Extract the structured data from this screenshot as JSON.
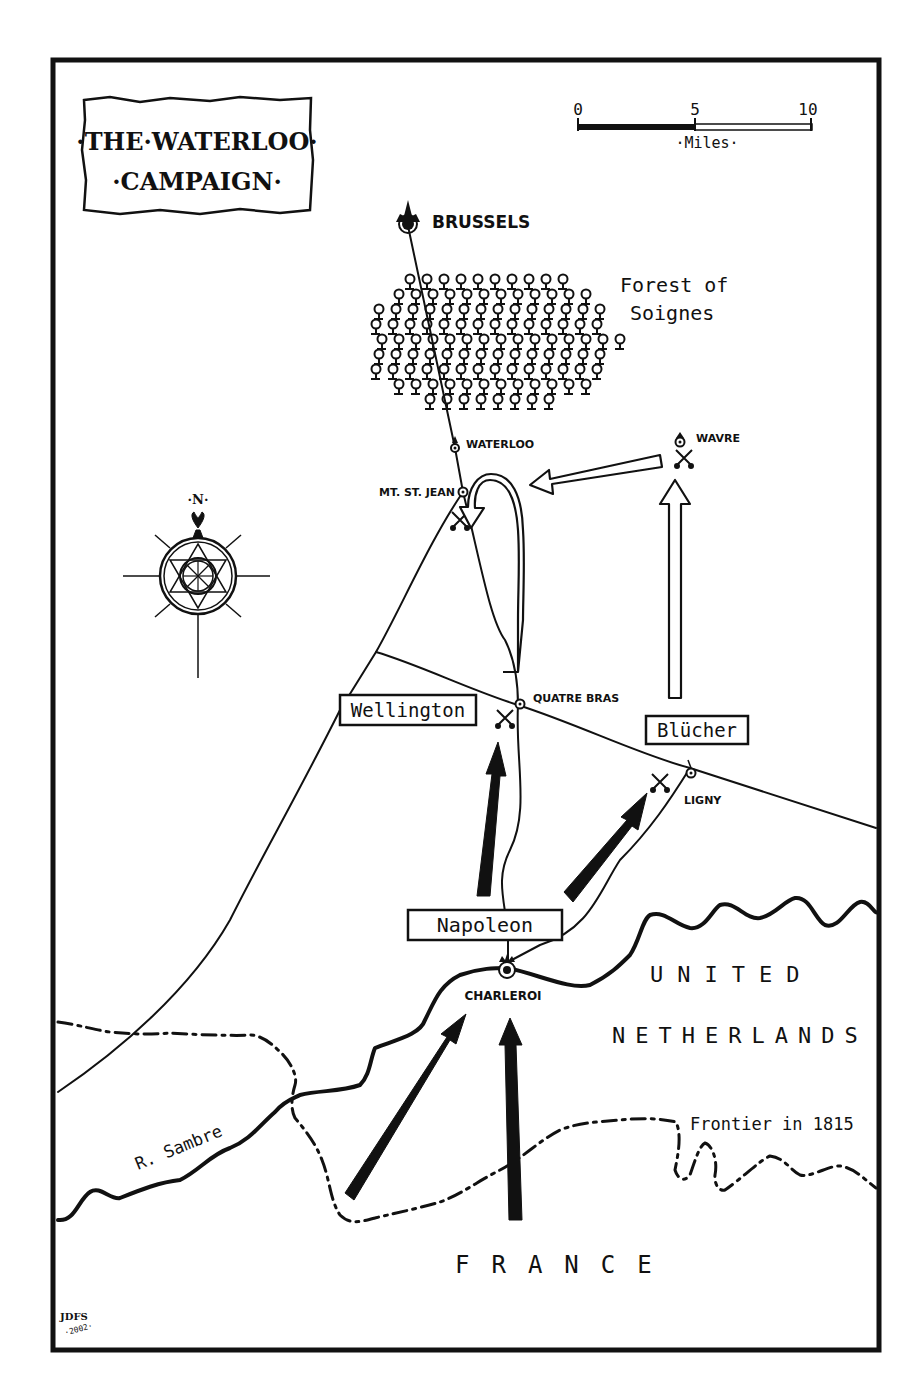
{
  "title": {
    "line1": "·THE·WATERLOO·",
    "line2": "·CAMPAIGN·"
  },
  "scale_bar": {
    "ticks": [
      "0",
      "5",
      "10"
    ],
    "unit_label": "·Miles·"
  },
  "compass": {
    "north_label": "·N·"
  },
  "places": {
    "brussels": "BRUSSELS",
    "waterloo": "WATERLOO",
    "mt_st_jean": "MT. ST. JEAN",
    "wavre": "WAVRE",
    "quatre_bras": "QUATRE BRAS",
    "ligny": "LIGNY",
    "charleroi": "CHARLEROI"
  },
  "features": {
    "forest_line1": "Forest of",
    "forest_line2": "Soignes",
    "river": "R. Sambre",
    "frontier": "Frontier in 1815"
  },
  "regions": {
    "united": "UNITED",
    "netherlands": "NETHERLANDS",
    "france": "FRANCE"
  },
  "armies": {
    "wellington": "Wellington",
    "blucher": "Blücher",
    "napoleon": "Napoleon"
  },
  "signature": {
    "initials": "JDFS",
    "year": "·2002·"
  },
  "battles": [
    {
      "name": "Waterloo (Mt. St. Jean)",
      "x": 460,
      "y": 520
    },
    {
      "name": "Wavre",
      "x": 684,
      "y": 458
    },
    {
      "name": "Quatre Bras",
      "x": 505,
      "y": 718
    },
    {
      "name": "Ligny",
      "x": 660,
      "y": 782
    }
  ],
  "colors": {
    "ink": "#111111",
    "paper": "#ffffff"
  }
}
